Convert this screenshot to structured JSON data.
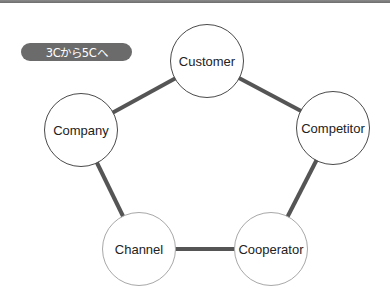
{
  "badge": {
    "label": "3Cから5Cへ",
    "color": "#6b6b6b"
  },
  "colors": {
    "edge": "#555555",
    "topbar": "#7a7a7a"
  },
  "nodes": [
    {
      "id": "customer",
      "label": "Customer",
      "cx": 207,
      "cy": 61,
      "style": "dark"
    },
    {
      "id": "competitor",
      "label": "Competitor",
      "cx": 333,
      "cy": 128,
      "style": "dark"
    },
    {
      "id": "cooperator",
      "label": "Cooperator",
      "cx": 271,
      "cy": 249,
      "style": "light"
    },
    {
      "id": "channel",
      "label": "Channel",
      "cx": 139,
      "cy": 249,
      "style": "light"
    },
    {
      "id": "company",
      "label": "Company",
      "cx": 81,
      "cy": 130,
      "style": "dark"
    }
  ],
  "edges": [
    [
      "customer",
      "competitor"
    ],
    [
      "competitor",
      "cooperator"
    ],
    [
      "cooperator",
      "channel"
    ],
    [
      "channel",
      "company"
    ],
    [
      "company",
      "customer"
    ]
  ]
}
